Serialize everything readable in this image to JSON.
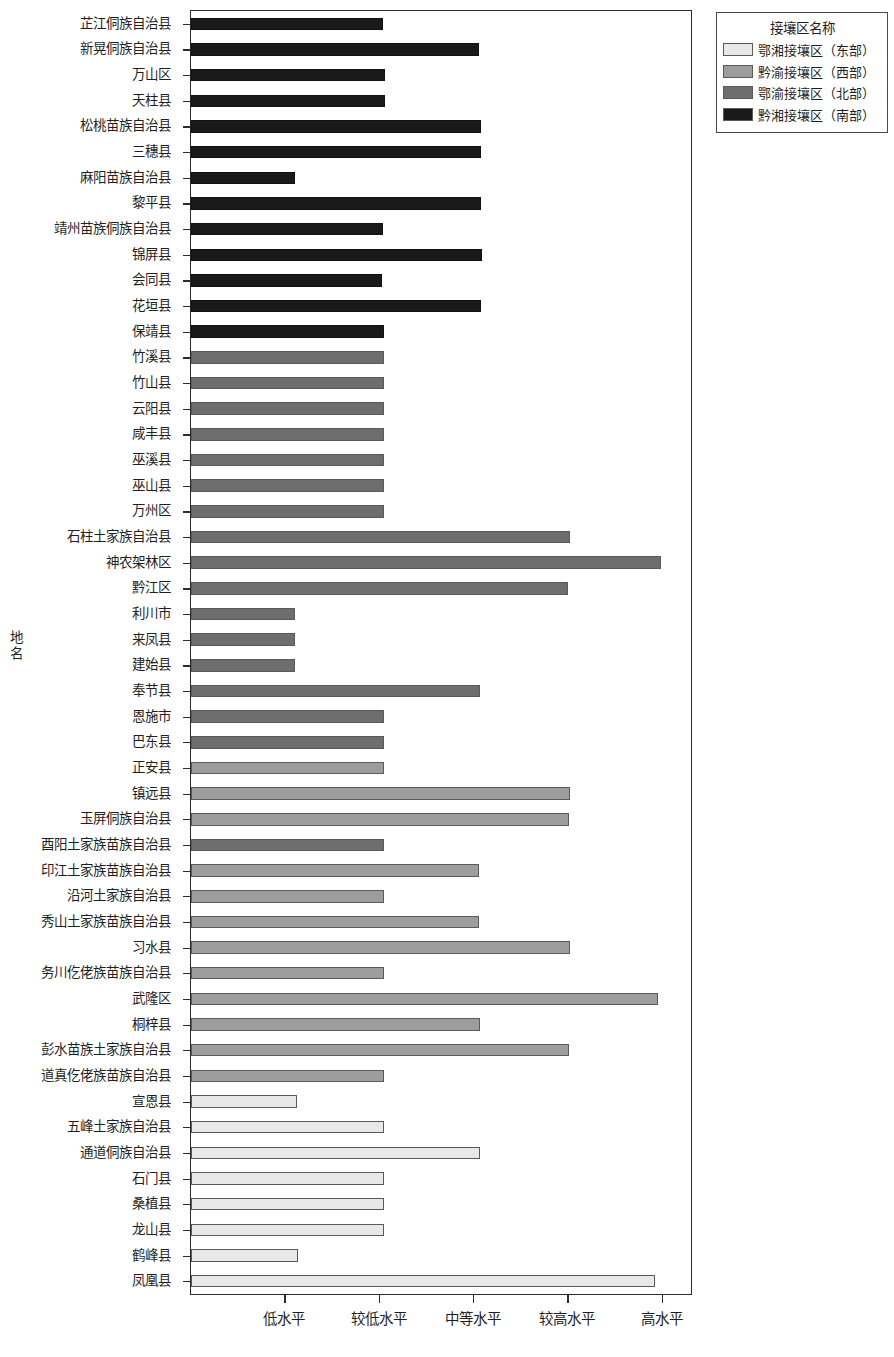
{
  "chart_data": {
    "type": "bar",
    "orientation": "horizontal",
    "title": "",
    "xlabel": "",
    "ylabel": "地名",
    "grid": false,
    "legend_position": "top-right",
    "legend_title": "接壤区名称",
    "x_tick_labels": [
      "低水平",
      "较低水平",
      "中等水平",
      "较高水平",
      "高水平"
    ],
    "x_tick_values": [
      1,
      2,
      3,
      4,
      5
    ],
    "xlim": [
      0,
      5.3
    ],
    "groups": [
      {
        "name": "鄂湘接壤区（东部）",
        "color": "#e8e8e8"
      },
      {
        "name": "黔渝接壤区（西部）",
        "color": "#9d9d9d"
      },
      {
        "name": "鄂渝接壤区（北部）",
        "color": "#6e6e6e"
      },
      {
        "name": "黔湘接壤区（南部）",
        "color": "#1a1a1a"
      }
    ],
    "categories": [
      "芷江侗族自治县",
      "新晃侗族自治县",
      "万山区",
      "天柱县",
      "松桃苗族自治县",
      "三穗县",
      "麻阳苗族自治县",
      "黎平县",
      "靖州苗族侗族自治县",
      "锦屏县",
      "会同县",
      "花垣县",
      "保靖县",
      "竹溪县",
      "竹山县",
      "云阳县",
      "咸丰县",
      "巫溪县",
      "巫山县",
      "万州区",
      "石柱土家族自治县",
      "神农架林区",
      "黔江区",
      "利川市",
      "来凤县",
      "建始县",
      "奉节县",
      "恩施市",
      "巴东县",
      "正安县",
      "镇远县",
      "玉屏侗族自治县",
      "酉阳土家族苗族自治县",
      "印江土家族苗族自治县",
      "沿河土家族自治县",
      "秀山土家族苗族自治县",
      "习水县",
      "务川仡佬族苗族自治县",
      "武隆区",
      "桐梓县",
      "彭水苗族土家族自治县",
      "道真仡佬族苗族自治县",
      "宣恩县",
      "五峰土家族自治县",
      "通道侗族自治县",
      "石门县",
      "桑植县",
      "龙山县",
      "鹤峰县",
      "凤凰县"
    ],
    "values": [
      2.03,
      3.05,
      2.06,
      2.06,
      3.07,
      3.07,
      1.1,
      3.07,
      2.04,
      3.08,
      2.02,
      3.07,
      2.05,
      2.05,
      2.05,
      2.05,
      2.05,
      2.05,
      2.05,
      2.05,
      4.02,
      4.98,
      4.0,
      1.1,
      1.1,
      1.1,
      3.06,
      2.05,
      2.05,
      2.05,
      4.02,
      4.01,
      2.05,
      3.05,
      2.05,
      3.05,
      4.02,
      2.05,
      4.95,
      3.06,
      4.01,
      2.05,
      1.12,
      2.05,
      3.06,
      2.05,
      2.05,
      2.05,
      1.13,
      4.92
    ],
    "bar_group_index": [
      3,
      3,
      3,
      3,
      3,
      3,
      3,
      3,
      3,
      3,
      3,
      3,
      3,
      2,
      2,
      2,
      2,
      2,
      2,
      2,
      2,
      2,
      2,
      2,
      2,
      2,
      2,
      2,
      2,
      1,
      1,
      1,
      2,
      1,
      1,
      1,
      1,
      1,
      1,
      1,
      1,
      1,
      0,
      0,
      0,
      0,
      0,
      0,
      0,
      0
    ]
  }
}
